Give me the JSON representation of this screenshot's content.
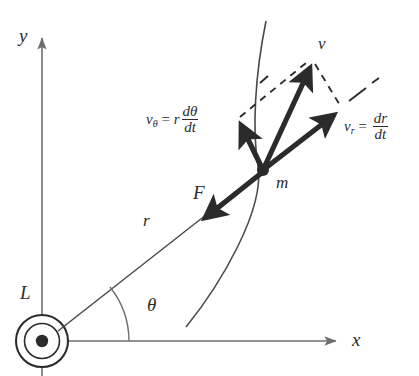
{
  "figure": {
    "type": "physics-vector-diagram",
    "stroke_color": "#2b2b2b",
    "axis_color": "#6e6e6e",
    "background": "#ffffff"
  },
  "axes": {
    "x_label": "x",
    "y_label": "y"
  },
  "labels": {
    "angular_momentum": "L",
    "mass": "m",
    "force": "F",
    "radius": "r",
    "angle": "θ",
    "velocity": "v"
  },
  "equations": {
    "v_theta": {
      "symbol": "v",
      "subscript": "θ",
      "equals": "=",
      "coefficient": "r",
      "numerator": "dθ",
      "denominator": "dt",
      "plain": "vθ = r dθ/dt"
    },
    "v_r": {
      "symbol": "v",
      "subscript": "r",
      "equals": "=",
      "coefficient": "",
      "numerator": "dr",
      "denominator": "dt",
      "plain": "vr = dr/dt"
    }
  },
  "geometry": {
    "origin": {
      "x": 42,
      "y": 341
    },
    "mass_point": {
      "x": 263,
      "y": 170
    },
    "y_axis_tip": {
      "x": 42,
      "y": 33
    },
    "x_axis_tip": {
      "x": 341,
      "y": 341
    },
    "v_tip": {
      "x": 311,
      "y": 61
    },
    "v_theta_tip": {
      "x": 237,
      "y": 121
    },
    "v_r_tip": {
      "x": 339,
      "y": 111
    },
    "force_tip": {
      "x": 200,
      "y": 221
    },
    "theta_degrees": 38
  }
}
